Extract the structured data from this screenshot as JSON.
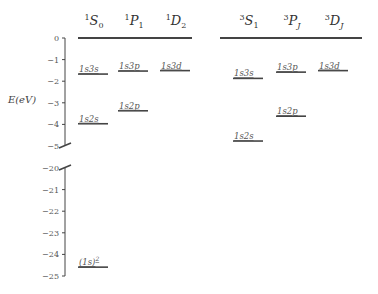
{
  "chart_data": {
    "type": "energy-level-diagram",
    "title": "",
    "ylabel": "E(eV)",
    "axis": {
      "upper_segment_ticks": [
        "0",
        "−1",
        "−2",
        "−3",
        "−4",
        "−5"
      ],
      "lower_segment_ticks": [
        "−20",
        "−21",
        "−22",
        "−23",
        "−24",
        "−25"
      ],
      "break_between": [
        -5,
        -20
      ]
    },
    "singlet": {
      "columns": [
        {
          "term": "S",
          "sup": "1",
          "sub": "0"
        },
        {
          "term": "P",
          "sup": "1",
          "sub": "1"
        },
        {
          "term": "D",
          "sup": "1",
          "sub": "2"
        }
      ],
      "levels": [
        {
          "label": "1s3s",
          "column": 0,
          "energy": -1.67
        },
        {
          "label": "1s3p",
          "column": 1,
          "energy": -1.53
        },
        {
          "label": "1s3d",
          "column": 2,
          "energy": -1.51
        },
        {
          "label": "1s2s",
          "column": 0,
          "energy": -3.97
        },
        {
          "label": "1s2p",
          "column": 1,
          "energy": -3.37
        },
        {
          "label": "(1s)",
          "sup": "2",
          "column": 0,
          "energy": -24.59
        }
      ]
    },
    "triplet": {
      "columns": [
        {
          "term": "S",
          "sup": "3",
          "sub": "1"
        },
        {
          "term": "P",
          "sup": "3",
          "sub": "J"
        },
        {
          "term": "D",
          "sup": "3",
          "sub": "J"
        }
      ],
      "levels": [
        {
          "label": "1s3s",
          "column": 0,
          "energy": -1.87
        },
        {
          "label": "1s3p",
          "column": 1,
          "energy": -1.58
        },
        {
          "label": "1s3d",
          "column": 2,
          "energy": -1.51
        },
        {
          "label": "1s2p",
          "column": 1,
          "energy": -3.62
        },
        {
          "label": "1s2s",
          "column": 0,
          "energy": -4.77
        }
      ]
    },
    "ionization_line_energy": 0
  }
}
